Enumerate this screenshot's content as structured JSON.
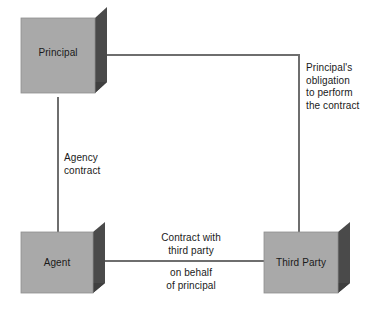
{
  "diagram": {
    "background_color": "#ffffff",
    "node_face_color": "#a9a9a9",
    "node_shadow_color": "#4a4a4a",
    "connector_color": "#6e6e6e",
    "text_color": "#1a1a1a",
    "nodes": [
      {
        "id": "principal",
        "label": "Principal"
      },
      {
        "id": "agent",
        "label": "Agent"
      },
      {
        "id": "third-party",
        "label": "Third Party"
      }
    ],
    "edges": [
      {
        "id": "principal-obligation",
        "from": "principal",
        "to": "third-party",
        "label": "Principal's\nobligation\nto perform\nthe contract"
      },
      {
        "id": "agency-contract",
        "from": "principal",
        "to": "agent",
        "label": "Agency\ncontract"
      },
      {
        "id": "third-party-contract",
        "from": "agent",
        "to": "third-party",
        "label_above": "Contract with\nthird party",
        "label_below": "on behalf\nof principal"
      }
    ]
  }
}
